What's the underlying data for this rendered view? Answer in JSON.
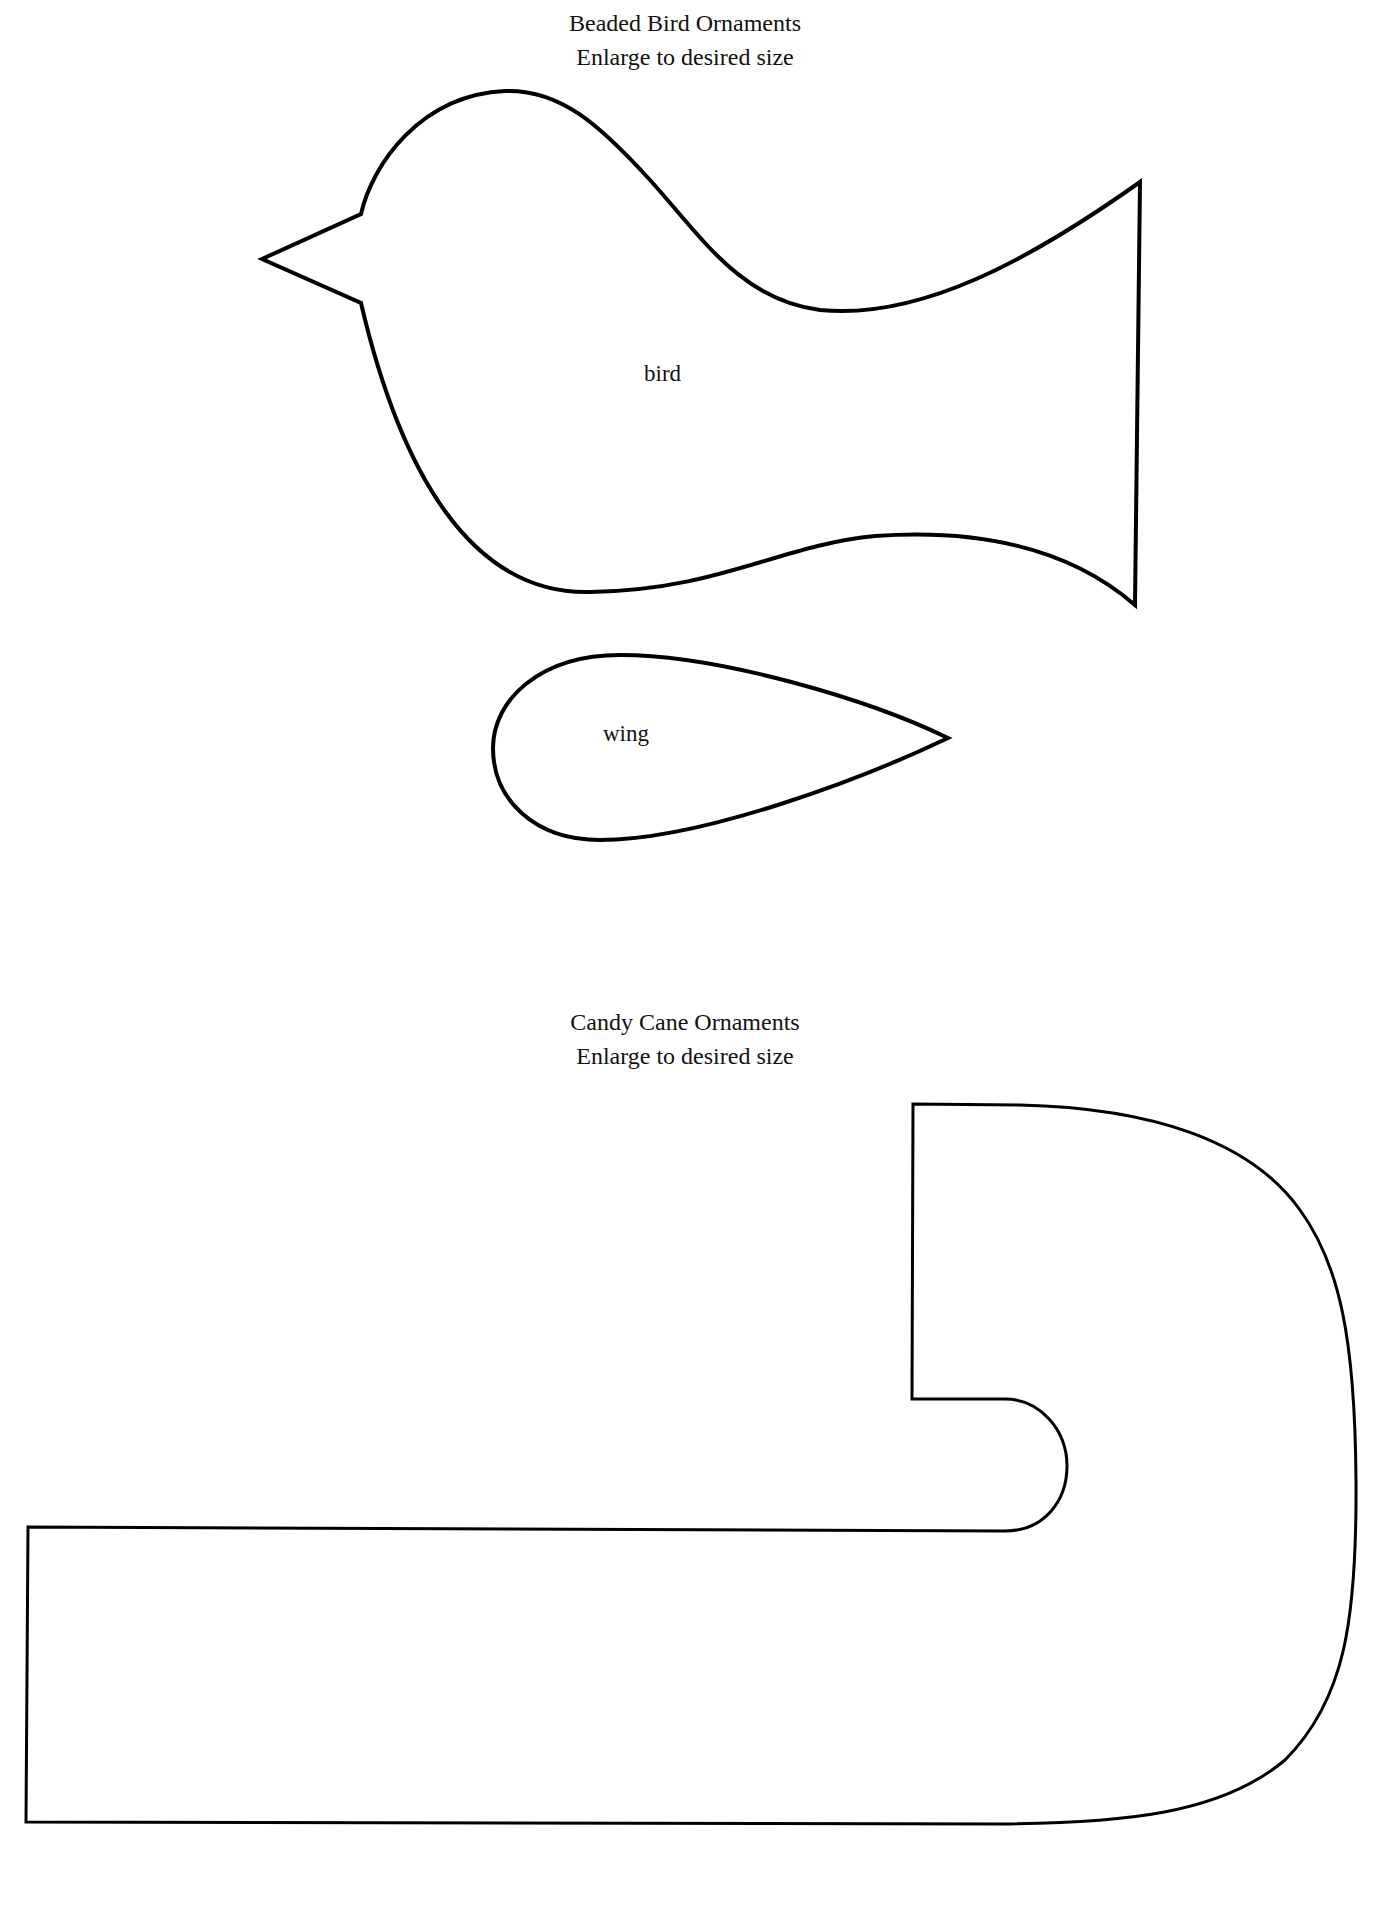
{
  "bird_section": {
    "title": "Beaded Bird Ornaments",
    "subtitle": "Enlarge to desired size",
    "shapes": [
      {
        "name": "bird",
        "label": "bird"
      },
      {
        "name": "wing",
        "label": "wing"
      }
    ]
  },
  "cane_section": {
    "title": "Candy Cane Ornaments",
    "subtitle": "Enlarge to desired size",
    "shapes": [
      {
        "name": "candy-cane",
        "label": ""
      }
    ]
  },
  "colors": {
    "outline": "#000000",
    "background": "#ffffff",
    "text": "#111111"
  }
}
